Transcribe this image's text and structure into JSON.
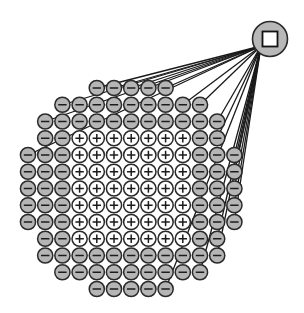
{
  "diagram": {
    "type": "charge-cluster-with-electrode",
    "colors": {
      "negative_fill": "#b5b5b5",
      "positive_fill": "#ffffff",
      "stroke": "#2a2a2a",
      "line": "#1a1a1a",
      "hub_fill": "#b8b8b8",
      "square_fill": "#ffffff"
    },
    "hub": {
      "cx": 270,
      "cy": 39,
      "r": 17.5,
      "square_size": 15,
      "symbol": "square"
    },
    "grid": {
      "x0": 28,
      "dx": 17.2,
      "y0": 88,
      "dy": 16.75,
      "radius": 7.6,
      "symbols": {
        "-": "minus",
        "+": "plus"
      }
    },
    "rows": [
      {
        "start": 4,
        "cells": "-----"
      },
      {
        "start": 2,
        "cells": "---------"
      },
      {
        "start": 1,
        "cells": "-----------"
      },
      {
        "start": 1,
        "cells": "--+++++++--"
      },
      {
        "start": 0,
        "cells": "---+++++++---"
      },
      {
        "start": 0,
        "cells": "---+++++++---"
      },
      {
        "start": 0,
        "cells": "---+++++++---"
      },
      {
        "start": 0,
        "cells": "---+++++++---"
      },
      {
        "start": 0,
        "cells": "---+++++++---"
      },
      {
        "start": 1,
        "cells": "--+++++++--"
      },
      {
        "start": 1,
        "cells": "-----------"
      },
      {
        "start": 2,
        "cells": "---------"
      },
      {
        "start": 4,
        "cells": "-----"
      }
    ],
    "connections": [
      [
        0,
        4
      ],
      [
        0,
        5
      ],
      [
        0,
        6
      ],
      [
        0,
        7
      ],
      [
        0,
        8
      ],
      [
        1,
        2
      ],
      [
        1,
        9
      ],
      [
        1,
        10
      ],
      [
        2,
        1
      ],
      [
        2,
        11
      ],
      [
        3,
        11
      ],
      [
        4,
        0
      ],
      [
        4,
        12
      ],
      [
        5,
        12
      ],
      [
        6,
        12
      ],
      [
        7,
        12
      ],
      [
        8,
        12
      ],
      [
        9,
        11
      ],
      [
        10,
        11
      ],
      [
        11,
        10
      ],
      [
        12,
        8
      ]
    ]
  }
}
